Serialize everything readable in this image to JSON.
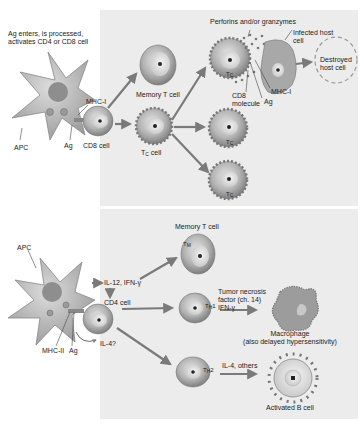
{
  "colors": {
    "background": "#ffffff",
    "panel": "#ececec",
    "cell_fill": "#b8b8b8",
    "cell_dark": "#8a8a8a",
    "arrow": "#7a7a7a",
    "text": "#222222"
  },
  "top_section": {
    "intro_text_line1": "Ag enters, is processed,",
    "intro_text_line2": "activates CD4 or CD8 cell",
    "apc_label": "APC",
    "mhc1_label": "MHC-I",
    "ag_label": "Ag",
    "cd8_cell_label": "CD8 cell",
    "memory_t_cell_label": "Memory T cell",
    "tc_cell_label": "T",
    "tc_cell_sub": "C",
    "tc_cell_suffix": " cell",
    "perforins_label": "Perforins and/or granzymes",
    "infected_host_line1": "Infected host",
    "infected_host_line2": "cell",
    "destroyed_line1": "Destroyed",
    "destroyed_line2": "host cell",
    "cd8_molecule_line1": "CD8",
    "cd8_molecule_line2": "molecule",
    "mhc1_right_label": "MHC-I",
    "ag_right_label": "Ag",
    "tc_marker": "T",
    "tc_marker_sub": "C"
  },
  "bottom_section": {
    "apc_label": "APC",
    "il12_label": "IL-12, IFN-γ",
    "cd4_cell_label": "CD4 cell",
    "mhc2_label": "MHC-II",
    "ag_label": "Ag",
    "il4q_label": "IL-4?",
    "memory_t_cell_label": "Memory T cell",
    "tm_marker": "T",
    "tm_marker_sub": "M",
    "th1_marker": "T",
    "th1_marker_sub": "H",
    "th1_marker_suffix": "1",
    "th2_marker": "T",
    "th2_marker_sub": "H",
    "th2_marker_suffix": "2",
    "tnf_line1": "Tumor necrosis",
    "tnf_line2": "factor (ch. 14)",
    "tnf_line3": "IFN-γ",
    "macrophage_line1": "Macrophage",
    "macrophage_line2": "(also delayed hypersensitivity)",
    "il4_others_label": "IL-4, others",
    "activated_b_cell_label": "Activated B cell"
  }
}
